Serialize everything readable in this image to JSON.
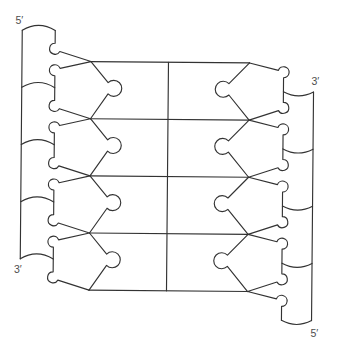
{
  "figure": {
    "base_pairs": 4,
    "labels": {
      "left_top": "5′",
      "left_bottom": "3′",
      "right_top": "3′",
      "right_bottom": "5′"
    },
    "colors": {
      "line": "#333333",
      "label": "#4d4d4d",
      "background": "#ffffff"
    }
  }
}
